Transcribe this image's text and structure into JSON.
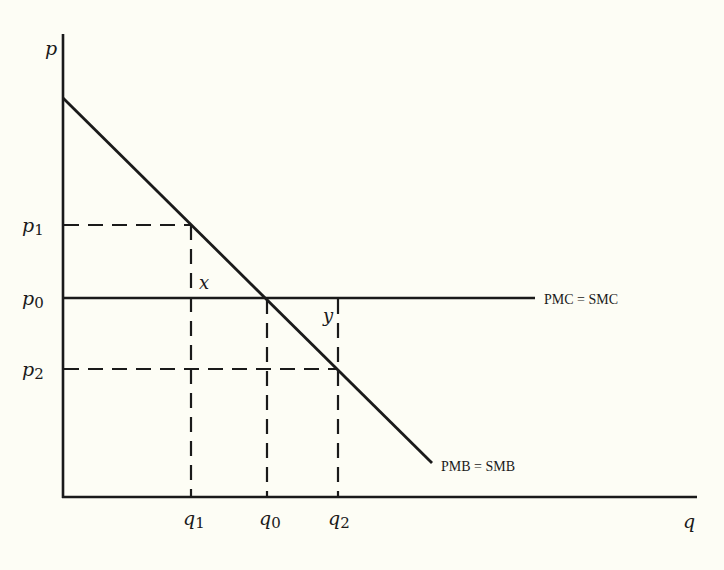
{
  "diagram": {
    "type": "economics-supply-demand",
    "axes": {
      "y_label": "p",
      "x_label": "q"
    },
    "price_ticks": [
      {
        "id": "p1",
        "base": "p",
        "sub": "1"
      },
      {
        "id": "p0",
        "base": "p",
        "sub": "0"
      },
      {
        "id": "p2",
        "base": "p",
        "sub": "2"
      }
    ],
    "quantity_ticks": [
      {
        "id": "q1",
        "base": "q",
        "sub": "1"
      },
      {
        "id": "q0",
        "base": "q",
        "sub": "0"
      },
      {
        "id": "q2",
        "base": "q",
        "sub": "2"
      }
    ],
    "curves": {
      "cost": "PMC = SMC",
      "benefit": "PMB = SMB"
    },
    "areas": {
      "x": "x",
      "y": "y"
    },
    "colors": {
      "background": "#fdfdf5",
      "ink": "#1a1a1a"
    }
  }
}
